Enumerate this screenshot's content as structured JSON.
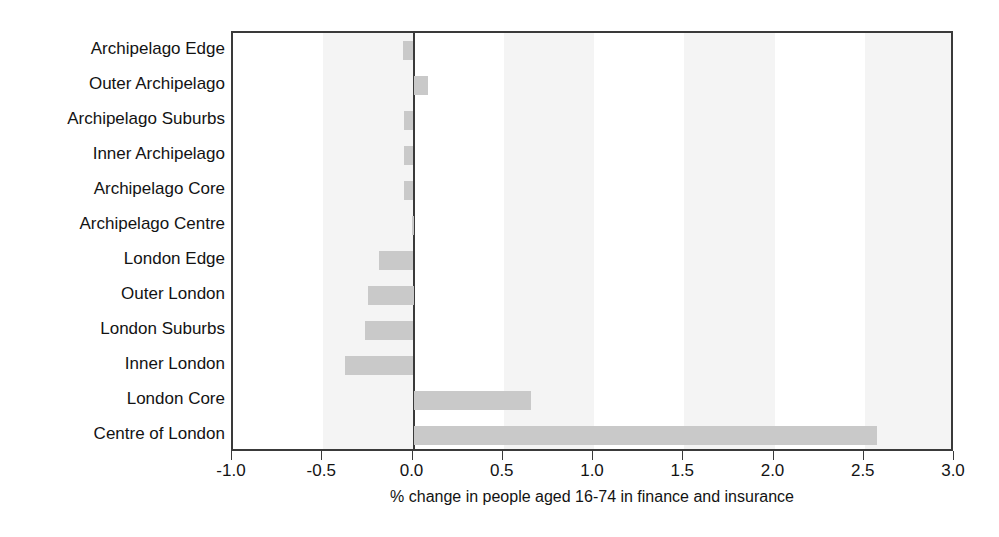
{
  "chart_data": {
    "type": "bar",
    "orientation": "horizontal",
    "title": "",
    "xlabel": "% change in people aged 16-74 in finance and insurance",
    "ylabel": "",
    "xlim": [
      -1.0,
      3.0
    ],
    "xticks": [
      "-1.0",
      "-0.5",
      "0.0",
      "0.5",
      "1.0",
      "1.5",
      "2.0",
      "2.5",
      "3.0"
    ],
    "xtick_values": [
      -1.0,
      -0.5,
      0.0,
      0.5,
      1.0,
      1.5,
      2.0,
      2.5,
      3.0
    ],
    "grid": false,
    "legend": "none",
    "bar_color": "#c9c9c9",
    "axis_color": "#3a3a3a",
    "band_color": "#f4f4f4",
    "categories": [
      "Archipelago Edge",
      "Outer Archipelago",
      "Archipelago Suburbs",
      "Inner Archipelago",
      "Archipelago Core",
      "Archipelago Centre",
      "London Edge",
      "Outer London",
      "London Suburbs",
      "Inner London",
      "London Core",
      "Centre of London"
    ],
    "values": [
      -0.06,
      0.08,
      -0.05,
      -0.05,
      -0.05,
      -0.01,
      -0.19,
      -0.25,
      -0.27,
      -0.38,
      0.65,
      2.57
    ]
  }
}
